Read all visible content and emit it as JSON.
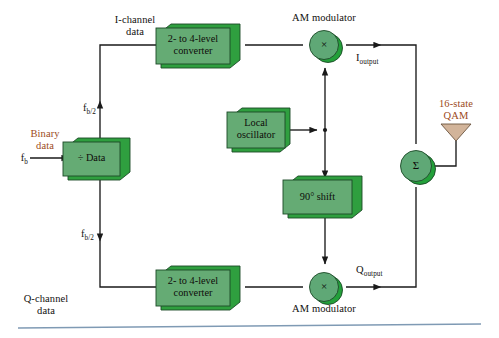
{
  "diagram": {
    "palette": {
      "box_face": "#65ab74",
      "box_side": "#2f9f3f",
      "box_border": "#1c4a27",
      "circle_face": "#5fa876",
      "circle_side": "#23a03a",
      "antenna_fill": "#d2b49a",
      "antenna_stroke": "#6b5540",
      "line": "#1a1a1a",
      "text": "#12100e",
      "accent_red": "#9c4a21",
      "footer_rule": "#7f9ab4"
    },
    "blocks": [
      {
        "id": "bit-splitter",
        "line1": "÷ Data",
        "line2": ""
      },
      {
        "id": "i-converter",
        "line1": "2- to 4-level",
        "line2": "converter"
      },
      {
        "id": "q-converter",
        "line1": "2- to 4-level",
        "line2": "converter"
      },
      {
        "id": "local-oscillator",
        "line1": "Local",
        "line2": "oscillator"
      },
      {
        "id": "phase-shift",
        "line1": "90° shift",
        "line2": ""
      }
    ],
    "operators": [
      {
        "id": "i-am-modulator",
        "symbol": "×"
      },
      {
        "id": "q-am-modulator",
        "symbol": "×"
      },
      {
        "id": "linear-summer",
        "symbol": "Σ"
      }
    ],
    "labels": {
      "binary_data_l1": "Binary",
      "binary_data_l2": "data",
      "fb_input": "f",
      "fb_input_sub": "b",
      "fb_half_top": "f",
      "fb_half_top_sub": "b/2",
      "fb_half_bottom": "f",
      "fb_half_bottom_sub": "b/2",
      "i_channel_l1": "I-channel",
      "i_channel_l2": "data",
      "q_channel_l1": "Q-channel",
      "q_channel_l2": "data",
      "am_modulator_top": "AM modulator",
      "am_modulator_bottom": "AM modulator",
      "i_output": "I",
      "i_output_sub": "output",
      "q_output": "Q",
      "q_output_sub": "output",
      "qam_l1": "16-state",
      "qam_l2": "QAM"
    }
  }
}
